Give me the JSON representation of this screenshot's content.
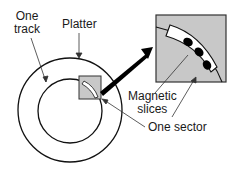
{
  "diagram": {
    "labels": {
      "track": [
        "One",
        "track"
      ],
      "platter": "Platter",
      "magnetic": [
        "Magnetic",
        "slices"
      ],
      "sector": "One sector"
    },
    "colors": {
      "stroke": "#111111",
      "inset_fill": "#c8c8c8",
      "sector_fill": "#ffffff",
      "slice_fill": "#000000"
    }
  }
}
